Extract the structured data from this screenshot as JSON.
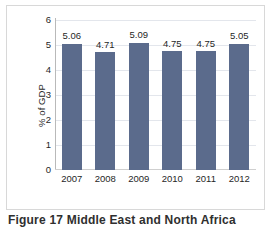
{
  "chart_data": {
    "type": "bar",
    "title": "",
    "xlabel": "",
    "ylabel": "% of GDP",
    "categories": [
      "2007",
      "2008",
      "2009",
      "2010",
      "2011",
      "2012"
    ],
    "values": [
      5.06,
      4.71,
      5.09,
      4.75,
      4.75,
      5.05
    ],
    "value_labels": [
      "5.06",
      "4.71",
      "5.09",
      "4.75",
      "4.75",
      "5.05"
    ],
    "ylim": [
      0,
      6
    ],
    "ytick_labels": [
      "0",
      "1",
      "2",
      "3",
      "4",
      "5",
      "6"
    ],
    "yticks": [
      0,
      1,
      2,
      3,
      4,
      5,
      6
    ],
    "grid": true,
    "legend": "none",
    "series": [
      {
        "name": "% of GDP",
        "values": [
          5.06,
          4.71,
          5.09,
          4.75,
          4.75,
          5.05
        ]
      }
    ]
  },
  "colors": {
    "bar": "#5b6b8c",
    "gridline": "#e3e6ec",
    "axis": "#b9b9b9",
    "frame": "#d8d8d8",
    "text": "#1f1f1f"
  },
  "caption": {
    "text": "Figure 17 Middle East and North Africa"
  }
}
